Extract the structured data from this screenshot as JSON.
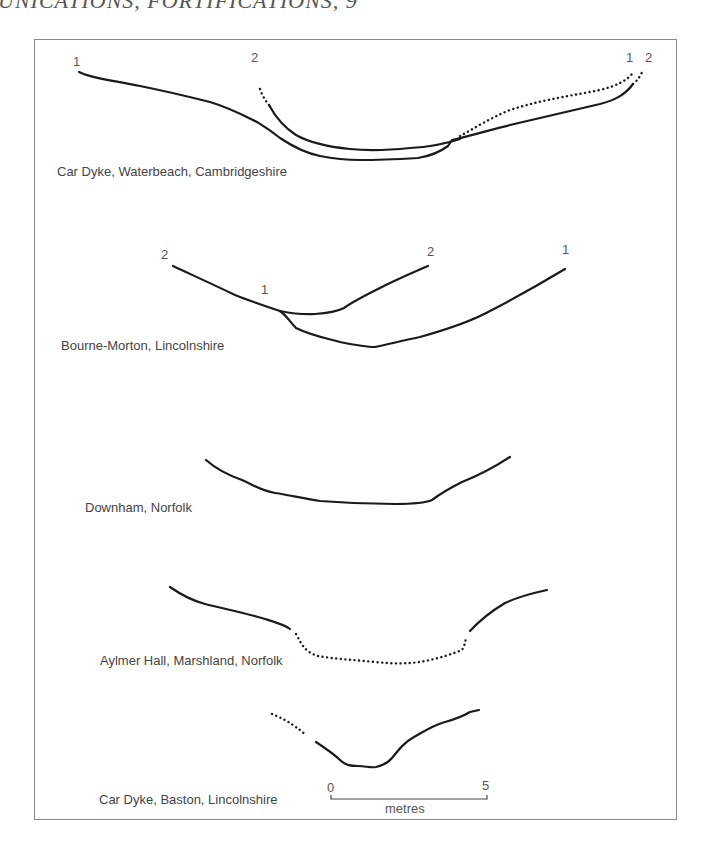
{
  "header": {
    "running_head": "UNICATIONS, FORTIFICATIONS, 9"
  },
  "figure": {
    "profiles": [
      {
        "site": "Car Dyke, Waterbeach, Cambridgeshire",
        "markers": [
          "1",
          "2",
          "1",
          "2"
        ]
      },
      {
        "site": "Bourne-Morton, Lincolnshire",
        "markers": [
          "2",
          "1",
          "2",
          "1"
        ]
      },
      {
        "site": "Downham, Norfolk",
        "markers": []
      },
      {
        "site": "Aylmer Hall, Marshland, Norfolk",
        "markers": []
      },
      {
        "site": "Car Dyke, Baston, Lincolnshire",
        "markers": []
      }
    ],
    "scale_bar": {
      "start_label": "0",
      "end_label": "5",
      "unit_label": "metres"
    }
  }
}
